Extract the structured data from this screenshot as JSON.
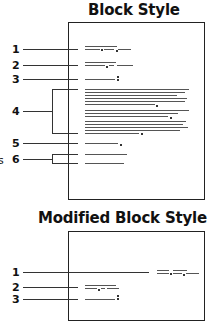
{
  "diagrams": [
    {
      "title": "Block Style",
      "labels": [
        "1",
        "2",
        "3",
        "4",
        "5",
        "6"
      ],
      "parts": [
        "date",
        "inside address",
        "salutation",
        "body",
        "closing",
        "signature"
      ]
    },
    {
      "title": "Modified Block Style",
      "labels": [
        "1",
        "2",
        "3"
      ],
      "parts": [
        "date",
        "inside address",
        "salutation"
      ]
    }
  ],
  "edge_fragment": "s",
  "colors": {
    "ink": "#222222",
    "text_line": "#555555",
    "background": "#ffffff"
  }
}
